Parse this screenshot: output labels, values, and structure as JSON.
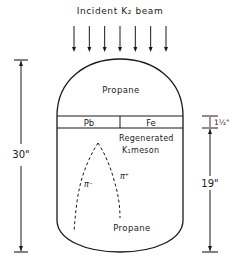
{
  "title": "Incident K₂ beam",
  "chamber": {
    "upper_region_label": "Propane",
    "lower_region_label": "Propane",
    "plates": [
      {
        "label": "Pb"
      },
      {
        "label": "Fe"
      }
    ],
    "regenerated_label_line1": "Regenerated",
    "regenerated_label_line2": "K₁meson"
  },
  "tracks": [
    {
      "label": "π⁻"
    },
    {
      "label": "π⁺"
    }
  ],
  "dimensions": {
    "total_height": "30\"",
    "plate_thickness": "1½\"",
    "lower_height": "19\""
  },
  "beam_arrow_count": 7,
  "colors": {
    "ink": "#1a1a1a",
    "background": "#ffffff"
  }
}
